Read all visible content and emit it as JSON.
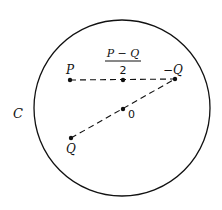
{
  "diagram": {
    "circle_label": "C",
    "points": {
      "P": {
        "label": "P",
        "x": 70,
        "y": 80
      },
      "mid": {
        "label_num": "P − Q",
        "label_den": "2",
        "x": 123,
        "y": 80
      },
      "negQ": {
        "label": "−Q",
        "x": 175,
        "y": 79
      },
      "origin": {
        "label": "0",
        "x": 123,
        "y": 109
      },
      "Q": {
        "label": "Q",
        "x": 71,
        "y": 138
      }
    },
    "circle": {
      "cx": 122,
      "cy": 108,
      "r": 88
    },
    "segments": [
      {
        "from": "P",
        "to": "negQ",
        "style": "dashed"
      },
      {
        "from": "Q",
        "to": "negQ",
        "style": "dashed"
      }
    ],
    "colors": {
      "stroke": "#111111",
      "background": "#ffffff"
    }
  }
}
